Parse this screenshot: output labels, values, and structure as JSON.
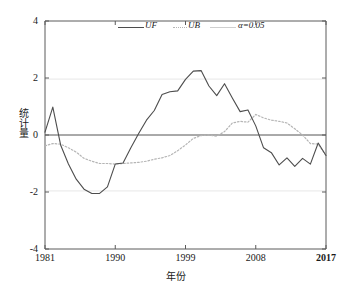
{
  "chart_data": {
    "type": "line",
    "title": "",
    "xlabel": "年份",
    "ylabel": "统计量",
    "xlim": [
      1981,
      2017
    ],
    "ylim": [
      -4,
      4
    ],
    "xticks": [
      1981,
      1990,
      1999,
      2008,
      2017
    ],
    "xtick_labels": [
      "1981",
      "1990",
      "1999",
      "2008",
      "2017"
    ],
    "yticks": [
      4,
      2,
      0,
      -2,
      -4
    ],
    "ytick_labels": [
      "4",
      "2",
      "0",
      "-2",
      "-4"
    ],
    "grid": "horizontal-light",
    "legend": {
      "position": "top-center",
      "entries": [
        {
          "label": "UF",
          "color": "#4d4d4d",
          "style": "solid"
        },
        {
          "label": "UB",
          "color": "#b5b5b5",
          "style": "dotted"
        },
        {
          "label": "α=0.05",
          "color": "#cfcfcf",
          "style": "solid"
        }
      ]
    },
    "reference_lines": [
      {
        "name": "zero-line",
        "y": 0,
        "color": "#555555"
      },
      {
        "name": "alpha-upper",
        "y": 1.96,
        "color": "#e2e2e2"
      },
      {
        "name": "alpha-lower",
        "y": -1.96,
        "color": "#e2e2e2"
      }
    ],
    "x": [
      1981,
      1982,
      1983,
      1984,
      1985,
      1986,
      1987,
      1988,
      1989,
      1990,
      1991,
      1992,
      1993,
      1994,
      1995,
      1996,
      1997,
      1998,
      1999,
      2000,
      2001,
      2002,
      2003,
      2004,
      2005,
      2006,
      2007,
      2008,
      2009,
      2010,
      2011,
      2012,
      2013,
      2014,
      2015,
      2016,
      2017
    ],
    "series": [
      {
        "name": "UF",
        "color": "#4d4d4d",
        "style": "solid",
        "values": [
          0.1,
          0.98,
          -0.35,
          -1.02,
          -1.55,
          -1.9,
          -2.05,
          -2.05,
          -1.82,
          -1.02,
          -0.98,
          -0.45,
          0.05,
          0.52,
          0.86,
          1.42,
          1.52,
          1.55,
          1.95,
          2.24,
          2.26,
          1.72,
          1.38,
          1.8,
          1.3,
          0.82,
          0.88,
          0.32,
          -0.45,
          -0.62,
          -1.05,
          -0.8,
          -1.1,
          -0.82,
          -1.02,
          -0.28,
          -0.72
        ]
      },
      {
        "name": "UB",
        "color": "#b5b5b5",
        "style": "dotted",
        "values": [
          -0.38,
          -0.3,
          -0.32,
          -0.45,
          -0.6,
          -0.82,
          -0.92,
          -1.0,
          -1.0,
          -1.02,
          -1.0,
          -0.98,
          -0.96,
          -0.92,
          -0.85,
          -0.8,
          -0.72,
          -0.55,
          -0.35,
          -0.12,
          -0.02,
          0.0,
          -0.04,
          0.12,
          0.42,
          0.48,
          0.45,
          0.72,
          0.6,
          0.52,
          0.48,
          0.42,
          0.22,
          0.0,
          -0.3,
          -0.32,
          -0.72
        ]
      }
    ]
  }
}
